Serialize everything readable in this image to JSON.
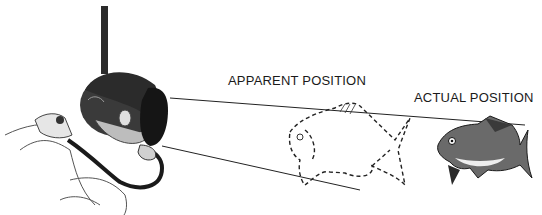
{
  "diagram": {
    "labels": {
      "apparent": "APPARENT POSITION",
      "actual": "ACTUAL POSITION"
    },
    "elements": {
      "diver": "diver-with-mask-and-snorkel",
      "apparent_fish": "dashed-outline-fish",
      "actual_fish": "shaded-fish",
      "sight_lines": 2
    },
    "colors": {
      "ink": "#1a1a1a",
      "background": "#ffffff"
    }
  }
}
